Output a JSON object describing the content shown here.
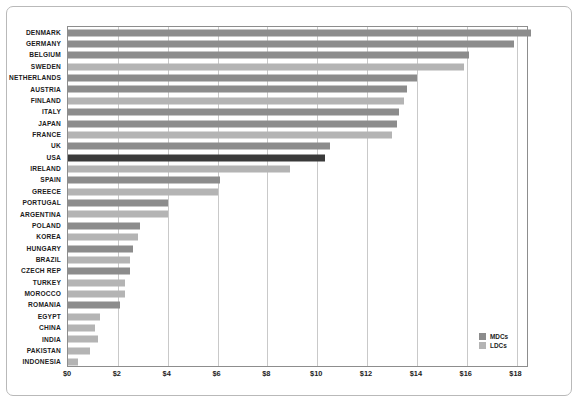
{
  "chart_data": {
    "type": "bar",
    "orientation": "horizontal",
    "title": "",
    "xlabel": "",
    "ylabel": "",
    "xlim": [
      0,
      18.5
    ],
    "xticks": [
      0,
      2,
      4,
      6,
      8,
      10,
      12,
      14,
      16,
      18
    ],
    "xticklabels": [
      "$0",
      "$2",
      "$4",
      "$6",
      "$8",
      "$10",
      "$12",
      "$14",
      "$16",
      "$18"
    ],
    "grid": true,
    "legend_position": "bottom-right",
    "legend": [
      {
        "name": "MDCs",
        "color": "#8c8c8c"
      },
      {
        "name": "LDCs",
        "color": "#b4b4b4"
      }
    ],
    "highlight": {
      "category": "USA",
      "color": "#3a3a3a"
    },
    "categories": [
      "DENMARK",
      "GERMANY",
      "BELGIUM",
      "SWEDEN",
      "NETHERLANDS",
      "AUSTRIA",
      "FINLAND",
      "ITALY",
      "JAPAN",
      "FRANCE",
      "UK",
      "USA",
      "IRELAND",
      "SPAIN",
      "GREECE",
      "PORTUGAL",
      "ARGENTINA",
      "POLAND",
      "KOREA",
      "HUNGARY",
      "BRAZIL",
      "CZECH REP",
      "TURKEY",
      "MOROCCO",
      "ROMANIA",
      "EGYPT",
      "CHINA",
      "INDIA",
      "PAKISTAN",
      "INDONESIA"
    ],
    "values": [
      18.6,
      17.9,
      16.1,
      15.9,
      14.0,
      13.6,
      13.5,
      13.3,
      13.2,
      13.0,
      10.5,
      10.3,
      8.9,
      6.1,
      6.0,
      4.0,
      4.0,
      2.9,
      2.8,
      2.6,
      2.5,
      2.5,
      2.3,
      2.3,
      2.1,
      1.3,
      1.1,
      1.2,
      0.9,
      0.4
    ],
    "series_of": [
      "MDCs",
      "MDCs",
      "MDCs",
      "LDCs",
      "MDCs",
      "MDCs",
      "LDCs",
      "MDCs",
      "MDCs",
      "LDCs",
      "MDCs",
      "USA",
      "LDCs",
      "MDCs",
      "LDCs",
      "MDCs",
      "LDCs",
      "MDCs",
      "LDCs",
      "MDCs",
      "LDCs",
      "MDCs",
      "LDCs",
      "LDCs",
      "MDCs",
      "LDCs",
      "LDCs",
      "LDCs",
      "LDCs",
      "LDCs"
    ]
  }
}
